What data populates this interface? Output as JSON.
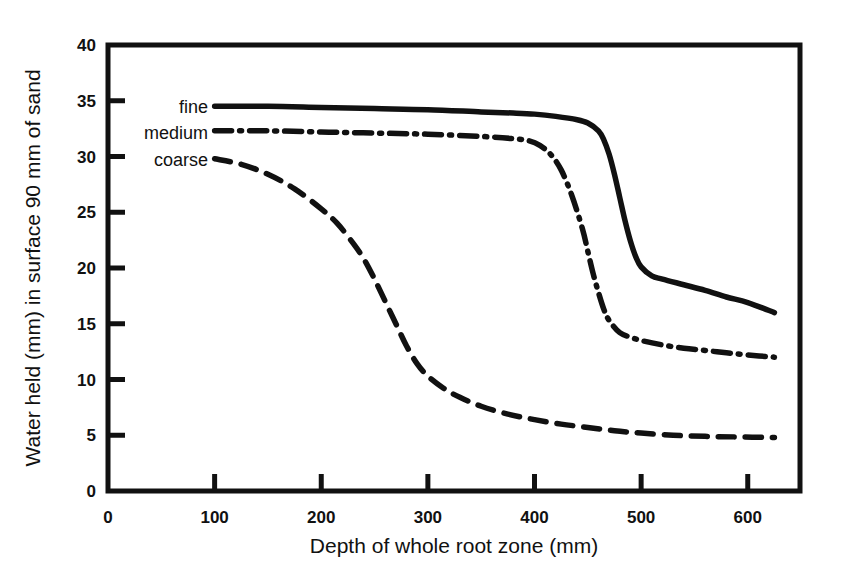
{
  "chart_data": {
    "type": "line",
    "title": "",
    "xlabel": "Depth of whole root zone (mm)",
    "ylabel": "Water held (mm) in surface 90 mm of sand",
    "xlim": [
      0,
      649
    ],
    "ylim": [
      0,
      40
    ],
    "xticks": [
      0,
      100,
      200,
      300,
      400,
      500,
      600
    ],
    "xtick_labels": [
      "0",
      "100",
      "200",
      "300",
      "400",
      "500",
      "600"
    ],
    "yticks": [
      0,
      5,
      10,
      15,
      20,
      25,
      30,
      35,
      40
    ],
    "ytick_labels": [
      "0",
      "5",
      "10",
      "15",
      "20",
      "25",
      "30",
      "35",
      "40"
    ],
    "grid": false,
    "legend_position": "upper-left-inside",
    "line_color": "#111111",
    "series": [
      {
        "name": "fine",
        "style": "solid",
        "x": [
          100,
          150,
          200,
          250,
          300,
          350,
          380,
          400,
          420,
          440,
          450,
          460,
          465,
          470,
          475,
          480,
          485,
          490,
          495,
          500,
          510,
          520,
          540,
          560,
          580,
          600,
          625
        ],
        "y": [
          34.5,
          34.5,
          34.4,
          34.3,
          34.2,
          34.0,
          33.9,
          33.8,
          33.6,
          33.3,
          33.0,
          32.3,
          31.5,
          30.2,
          28.4,
          26.3,
          24.2,
          22.4,
          21.0,
          20.1,
          19.3,
          19.0,
          18.5,
          18.0,
          17.4,
          16.9,
          16.0
        ]
      },
      {
        "name": "medium",
        "style": "dashdot",
        "x": [
          100,
          150,
          200,
          250,
          300,
          350,
          380,
          395,
          405,
          415,
          425,
          435,
          445,
          450,
          455,
          460,
          465,
          470,
          480,
          490,
          500,
          520,
          540,
          560,
          580,
          600,
          625
        ],
        "y": [
          32.3,
          32.3,
          32.2,
          32.1,
          32.0,
          31.8,
          31.6,
          31.4,
          31.0,
          30.2,
          28.8,
          26.5,
          23.5,
          21.5,
          19.5,
          17.8,
          16.3,
          15.3,
          14.2,
          13.8,
          13.5,
          13.1,
          12.8,
          12.6,
          12.4,
          12.2,
          12.0
        ]
      },
      {
        "name": "coarse",
        "style": "dashed",
        "x": [
          100,
          125,
          150,
          175,
          200,
          215,
          230,
          240,
          250,
          260,
          270,
          280,
          290,
          300,
          315,
          330,
          350,
          375,
          400,
          425,
          450,
          475,
          500,
          530,
          560,
          590,
          625
        ],
        "y": [
          29.8,
          29.3,
          28.4,
          27.1,
          25.3,
          24.0,
          22.2,
          20.8,
          19.0,
          17.0,
          15.0,
          13.0,
          11.4,
          10.3,
          9.2,
          8.4,
          7.6,
          6.9,
          6.4,
          6.0,
          5.7,
          5.4,
          5.2,
          5.0,
          4.9,
          4.85,
          4.8
        ]
      }
    ]
  },
  "legend": {
    "entries": [
      {
        "label": "fine"
      },
      {
        "label": "medium"
      },
      {
        "label": "coarse"
      }
    ]
  }
}
